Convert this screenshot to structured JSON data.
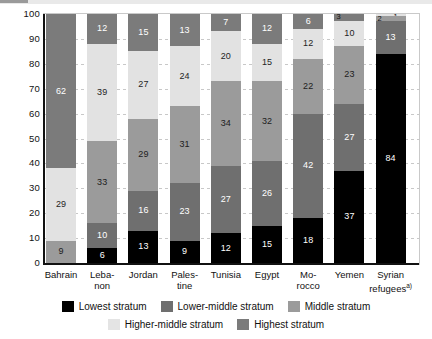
{
  "chart_data": {
    "type": "bar",
    "title": "",
    "subtitle": "",
    "xlabel": "",
    "ylabel": "",
    "ylim": [
      0,
      100
    ],
    "yticks": [
      0,
      10,
      20,
      30,
      40,
      50,
      60,
      70,
      80,
      90,
      100
    ],
    "ytick_labels": [
      "0",
      "10",
      "20",
      "30",
      "40",
      "50",
      "60",
      "70",
      "80",
      "90",
      "100"
    ],
    "grid": true,
    "stacked": true,
    "stack_order_bottom_to_top": [
      "Highest stratum",
      "Higher-middle stratum",
      "Middle stratum",
      "Lower-middle stratum",
      "Lowest stratum"
    ],
    "legend_position": "bottom",
    "categories": [
      "Bahrain",
      "Lebanon",
      "Jordan",
      "Palestine",
      "Tunisia",
      "Egypt",
      "Morocco",
      "Yemen",
      "Syrian refugees"
    ],
    "category_labels": [
      {
        "lines": [
          "Bahrain"
        ],
        "sup": ""
      },
      {
        "lines": [
          "Leba-",
          "non"
        ],
        "sup": ""
      },
      {
        "lines": [
          "Jordan"
        ],
        "sup": ""
      },
      {
        "lines": [
          "Pales-",
          "tine"
        ],
        "sup": ""
      },
      {
        "lines": [
          "Tunisia"
        ],
        "sup": ""
      },
      {
        "lines": [
          "Egypt"
        ],
        "sup": ""
      },
      {
        "lines": [
          "Mo-",
          "rocco"
        ],
        "sup": ""
      },
      {
        "lines": [
          "Yemen"
        ],
        "sup": ""
      },
      {
        "lines": [
          "Syrian",
          "refugees"
        ],
        "sup": "a)"
      }
    ],
    "series": [
      {
        "name": "Lowest stratum",
        "key": "lowest",
        "color": "#000000",
        "values": [
          null,
          6,
          13,
          9,
          12,
          15,
          18,
          37,
          84
        ]
      },
      {
        "name": "Lower-middle stratum",
        "key": "lower-middle",
        "color": "#6f6f6f",
        "values": [
          null,
          10,
          16,
          23,
          27,
          26,
          42,
          27,
          13
        ]
      },
      {
        "name": "Middle stratum",
        "key": "middle",
        "color": "#9b9b9b",
        "values": [
          9,
          33,
          29,
          31,
          34,
          32,
          22,
          23,
          2
        ]
      },
      {
        "name": "Higher-middle stratum",
        "key": "higher-middle",
        "color": "#e2e2e2",
        "values": [
          29,
          39,
          27,
          24,
          20,
          15,
          12,
          10,
          1
        ]
      },
      {
        "name": "Highest stratum",
        "key": "highest",
        "color": "#7b7b7b",
        "values": [
          62,
          12,
          15,
          13,
          7,
          12,
          6,
          3,
          null
        ]
      }
    ]
  },
  "legend": {
    "rows": [
      [
        {
          "label": "Lowest stratum",
          "key": "lowest"
        },
        {
          "label": "Lower-middle stratum",
          "key": "lower-middle"
        },
        {
          "label": "Middle stratum",
          "key": "middle"
        }
      ],
      [
        {
          "label": "Higher-middle stratum",
          "key": "higher-middle"
        },
        {
          "label": "Highest stratum",
          "key": "highest"
        }
      ]
    ]
  }
}
